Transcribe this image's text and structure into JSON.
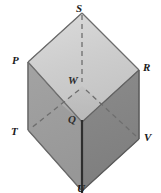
{
  "figure": {
    "kind": "cube-diagram",
    "background_color": "#ffffff"
  },
  "colors": {
    "top_face": "#cfcfcf",
    "left_face": "#9c9c9c",
    "right_face": "#848484",
    "interior_floor": "#b5b5b5",
    "edge_stroke": "#5a5a5a",
    "front_edge_stroke": "#2e2e2e",
    "hidden_edge_stroke": "#6e6e6e",
    "label_color": "#1a1a1a"
  },
  "labels": {
    "s": "S",
    "p": "P",
    "r": "R",
    "w": "W",
    "q": "Q",
    "t": "T",
    "v": "V",
    "u": "U"
  },
  "vertices": [
    {
      "name": "S",
      "x": 82,
      "y": 13,
      "hidden": false
    },
    {
      "name": "P",
      "x": 28,
      "y": 62,
      "hidden": false
    },
    {
      "name": "R",
      "x": 139,
      "y": 70,
      "hidden": false
    },
    {
      "name": "Q",
      "x": 82,
      "y": 122,
      "hidden": false
    },
    {
      "name": "W",
      "x": 82,
      "y": 86,
      "hidden": true
    },
    {
      "name": "T",
      "x": 28,
      "y": 130,
      "hidden": false
    },
    {
      "name": "V",
      "x": 139,
      "y": 139,
      "hidden": false
    },
    {
      "name": "U",
      "x": 82,
      "y": 191,
      "hidden": false
    }
  ],
  "edges": [
    {
      "from": "S",
      "to": "P",
      "style": "solid"
    },
    {
      "from": "S",
      "to": "R",
      "style": "solid"
    },
    {
      "from": "P",
      "to": "Q",
      "style": "solid"
    },
    {
      "from": "R",
      "to": "Q",
      "style": "solid"
    },
    {
      "from": "P",
      "to": "T",
      "style": "solid"
    },
    {
      "from": "R",
      "to": "V",
      "style": "solid"
    },
    {
      "from": "Q",
      "to": "U",
      "style": "solid-front"
    },
    {
      "from": "T",
      "to": "U",
      "style": "solid"
    },
    {
      "from": "V",
      "to": "U",
      "style": "solid"
    },
    {
      "from": "S",
      "to": "W",
      "style": "dashed"
    },
    {
      "from": "W",
      "to": "T",
      "style": "dashed"
    },
    {
      "from": "W",
      "to": "V",
      "style": "dashed"
    }
  ],
  "faces": [
    {
      "name": "top-face",
      "vertices": [
        "S",
        "P",
        "Q",
        "R"
      ],
      "shade": "light"
    },
    {
      "name": "left-face",
      "vertices": [
        "P",
        "Q",
        "U",
        "T"
      ],
      "shade": "medium"
    },
    {
      "name": "right-face",
      "vertices": [
        "R",
        "Q",
        "U",
        "V"
      ],
      "shade": "dark"
    }
  ]
}
